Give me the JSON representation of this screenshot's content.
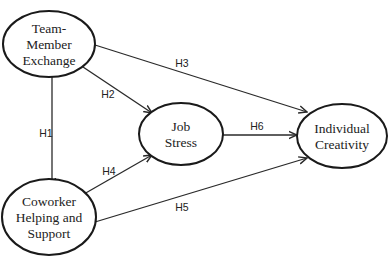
{
  "diagram": {
    "type": "research-model",
    "nodes": [
      {
        "id": "tmx",
        "lines": [
          "Team-",
          "Member",
          "Exchange"
        ],
        "cx": 49,
        "cy": 44,
        "rx": 46,
        "ry": 33
      },
      {
        "id": "chs",
        "lines": [
          "Coworker",
          "Helping and",
          "Support"
        ],
        "cx": 49,
        "cy": 217,
        "rx": 47,
        "ry": 38
      },
      {
        "id": "js",
        "lines": [
          "Job",
          "Stress"
        ],
        "cx": 181,
        "cy": 134,
        "rx": 42,
        "ry": 31
      },
      {
        "id": "ic",
        "lines": [
          "Individual",
          "Creativity"
        ],
        "cx": 342,
        "cy": 136,
        "rx": 45,
        "ry": 32
      }
    ],
    "edges": [
      {
        "id": "h1",
        "label": "H1",
        "from": "tmx",
        "to": "chs",
        "x1": 52,
        "y1": 77,
        "x2": 52,
        "y2": 186,
        "lx": 46,
        "ly": 137
      },
      {
        "id": "h2",
        "label": "H2",
        "from": "tmx",
        "to": "js",
        "x1": 83,
        "y1": 67,
        "x2": 152,
        "y2": 113,
        "lx": 108,
        "ly": 98
      },
      {
        "id": "h3",
        "label": "H3",
        "from": "tmx",
        "to": "ic",
        "x1": 95,
        "y1": 45,
        "x2": 307,
        "y2": 112,
        "lx": 182,
        "ly": 67
      },
      {
        "id": "h4",
        "label": "H4",
        "from": "chs",
        "to": "js",
        "x1": 84,
        "y1": 194,
        "x2": 152,
        "y2": 155,
        "lx": 109,
        "ly": 175
      },
      {
        "id": "h5",
        "label": "H5",
        "from": "chs",
        "to": "ic",
        "x1": 95,
        "y1": 222,
        "x2": 307,
        "y2": 158,
        "lx": 182,
        "ly": 211
      },
      {
        "id": "h6",
        "label": "H6",
        "from": "js",
        "to": "ic",
        "x1": 223,
        "y1": 135,
        "x2": 297,
        "y2": 135,
        "lx": 257,
        "ly": 130
      }
    ]
  }
}
